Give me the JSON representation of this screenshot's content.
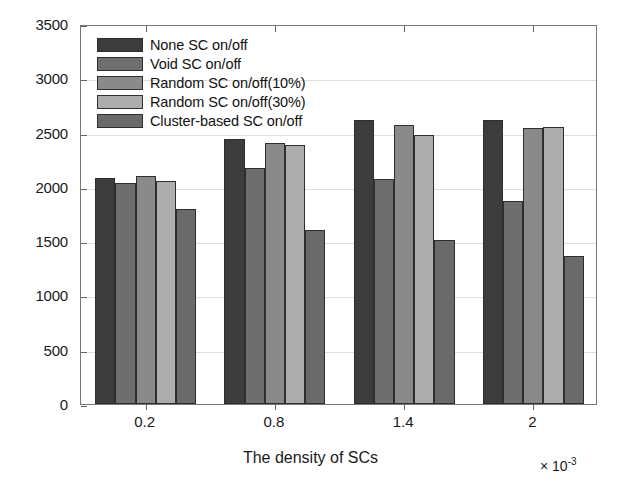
{
  "chart_data": {
    "type": "bar",
    "title": "",
    "subtitle": "",
    "xlabel": "The density of SCs",
    "ylabel": "RB Cost",
    "x_exponent_label": "× 10",
    "x_exponent_power": "-3",
    "categories": [
      "0.2",
      "0.8",
      "1.4",
      "2"
    ],
    "ylim": [
      0,
      3500
    ],
    "yticks": [
      0,
      500,
      1000,
      1500,
      2000,
      2500,
      3000,
      3500
    ],
    "ytick_labels": [
      "0",
      "500",
      "1000",
      "1500",
      "2000",
      "2500",
      "3000",
      "3500"
    ],
    "grid": true,
    "legend_position": "top-left-inside",
    "series": [
      {
        "name": "None SC on/off",
        "color": "#3c3c3c",
        "values": [
          2080,
          2440,
          2620,
          2620
        ]
      },
      {
        "name": "Void SC on/off",
        "color": "#6e6e6e",
        "values": [
          2040,
          2170,
          2070,
          1870
        ]
      },
      {
        "name": "Random SC on/off(10%)",
        "color": "#8a8a8a",
        "values": [
          2100,
          2400,
          2570,
          2540
        ]
      },
      {
        "name": "Random SC on/off(30%)",
        "color": "#adadad",
        "values": [
          2055,
          2385,
          2480,
          2550
        ]
      },
      {
        "name": "Cluster-based SC on/off",
        "color": "#6a6a6a",
        "values": [
          1800,
          1600,
          1510,
          1360
        ]
      }
    ]
  },
  "figure": {
    "background_color": "#ffffff",
    "axis_color": "#777777",
    "grid_color": "#dedede",
    "bar_edge_color": "#2e2e2e"
  }
}
